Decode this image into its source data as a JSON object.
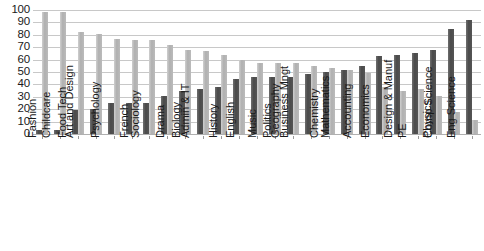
{
  "chart_data": {
    "type": "bar",
    "title": "",
    "subtitle": "",
    "xlabel": "",
    "ylabel": "",
    "ylim": [
      0,
      100
    ],
    "yticks": [
      100,
      90,
      80,
      70,
      60,
      50,
      40,
      30,
      20,
      10,
      0
    ],
    "grid": true,
    "legend": "none",
    "orientation": "vertical",
    "grouping": "clustered",
    "categories": [
      "Fashion",
      "Childcare",
      "Food Tech",
      "Art and Design",
      "Psychology",
      "French",
      "Sociology",
      "Drama",
      "Biology",
      "Admin & IT",
      "History",
      "English",
      "Music",
      "Politics",
      "Geography",
      "Business Mngt",
      "Chemistry",
      "Mathematics",
      "Accounting",
      "Economics",
      "PE",
      "Design & Manuf",
      "Physics",
      "Comp Science",
      "Eng Science"
    ],
    "series": [
      {
        "name": "Series 1",
        "color": "#555555",
        "values": [
          3,
          3,
          19,
          20,
          25,
          25,
          25,
          31,
          35,
          36,
          38,
          44,
          46,
          46,
          46,
          48,
          50,
          52,
          55,
          63,
          64,
          65,
          68,
          85,
          92
        ]
      },
      {
        "name": "Series 2",
        "color": "#bbbbbb",
        "values": [
          98,
          98,
          82,
          81,
          77,
          76,
          76,
          72,
          68,
          67,
          64,
          60,
          57,
          57,
          57,
          55,
          53,
          52,
          49,
          38,
          35,
          36,
          31,
          18,
          11
        ]
      }
    ]
  },
  "axis": {
    "y_max": 100,
    "y_min": 0,
    "y_step": 10
  },
  "colors": {
    "series_a": "#555555",
    "series_b": "#bbbbbb",
    "gridline": "#c8c8c8",
    "text": "#1a1a1a",
    "background": "#ffffff"
  }
}
